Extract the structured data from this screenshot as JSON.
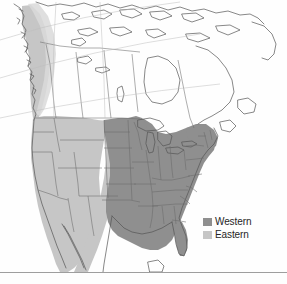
{
  "figure": {
    "type": "range-map",
    "region": "North America",
    "background_color": "#fefefe",
    "outline_color": "#4a4a4a",
    "bottom_rule_color": "#9e9e9e"
  },
  "legend": {
    "position": "bottom-right",
    "items": [
      {
        "label": "Western",
        "color": "#8f8f8f",
        "swatch_name": "legend-swatch-western"
      },
      {
        "label": "Eastern",
        "color": "#c6c6c6",
        "swatch_name": "legend-swatch-eastern"
      }
    ]
  },
  "map_layers": {
    "western_range": {
      "label": "Western",
      "fill": "#8f8f8f",
      "description": "Central and eastern United States shading"
    },
    "eastern_range": {
      "label": "Eastern",
      "fill": "#c6c6c6",
      "description": "Western United States and Pacific coastal band shading"
    },
    "landmass": {
      "fill": "#ffffff",
      "stroke": "#555555"
    },
    "lakes": {
      "fill": "#ffffff",
      "stroke": "#555555"
    },
    "internal_borders": {
      "stroke": "#6a6a6a"
    }
  }
}
